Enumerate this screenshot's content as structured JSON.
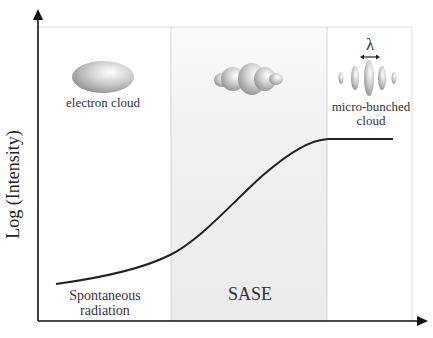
{
  "diagram": {
    "y_axis_label": "Log (Intensity)",
    "x_axis_label": "",
    "regions": [
      {
        "name": "Spontaneous radiation",
        "label_line1": "Spontaneous",
        "label_line2": "radiation",
        "fill": "#ffffff"
      },
      {
        "name": "SASE",
        "label_line1": "SASE",
        "fill": "#efefef"
      },
      {
        "name": "saturation",
        "label_line1": "",
        "fill": "#ffffff"
      }
    ],
    "illustrations": [
      {
        "name": "electron cloud",
        "label": "electron cloud"
      },
      {
        "name": "bunching cloud",
        "label": ""
      },
      {
        "name": "micro-bunched cloud",
        "label_line1": "micro-bunched",
        "label_line2": "cloud",
        "annotation": "λ"
      }
    ],
    "curve": {
      "description": "Log intensity grows slowly (spontaneous), exponentially (SASE), then saturates",
      "color": "#222222"
    }
  }
}
